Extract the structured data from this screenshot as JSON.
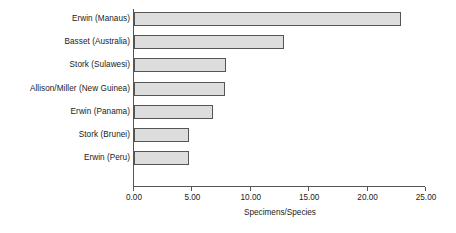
{
  "chart_data": {
    "type": "bar",
    "orientation": "horizontal",
    "title": "",
    "xlabel": "Specimens/Species",
    "ylabel": "",
    "categories": [
      "Erwin (Manaus)",
      "Basset (Australia)",
      "Stork (Sulawesi)",
      "Allison/Miller (New Guinea)",
      "Erwin (Panama)",
      "Stork (Brunei)",
      "Erwin (Peru)"
    ],
    "values": [
      22.9,
      12.8,
      7.9,
      7.8,
      6.8,
      4.7,
      4.7
    ],
    "xlim": [
      0,
      25
    ],
    "xticks": [
      0,
      5,
      10,
      15,
      20,
      25
    ],
    "xtick_labels": [
      "0.00",
      "5.00",
      "10.00",
      "15.00",
      "20.00",
      "25.00"
    ],
    "grid": false,
    "legend": false,
    "bar_fill_color": "#dddddd",
    "bar_border_color": "#555555",
    "axis_color": "#555555",
    "text_color": "#1a1a1a"
  }
}
